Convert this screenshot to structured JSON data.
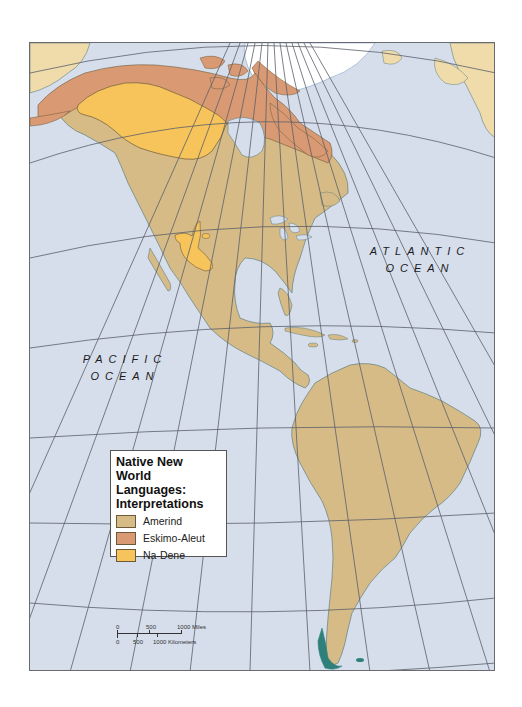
{
  "map": {
    "title": "Native New World Languages: Interpretations",
    "title_lines": [
      "Native New World",
      "Languages:",
      "Interpretations"
    ],
    "ocean_labels": {
      "atlantic": {
        "line1": "ATLANTIC",
        "line2": "OCEAN"
      },
      "pacific": {
        "line1": "PACIFIC",
        "line2": "OCEAN"
      }
    },
    "legend": {
      "items": [
        {
          "label": "Amerind",
          "color": "#d6bb86"
        },
        {
          "label": "Eskimo-Aleut",
          "color": "#d99a73"
        },
        {
          "label": "Na-Dene",
          "color": "#f6c45a"
        }
      ]
    },
    "scale_bar": {
      "miles_labels": [
        "0",
        "500",
        "1000 Miles"
      ],
      "km_labels": [
        "0",
        "500",
        "1000 Kilometers"
      ]
    },
    "colors": {
      "ocean": "#d6deec",
      "land_other": "#efdcaa",
      "ice": "#ffffff",
      "graticule": "#5a5f6a",
      "coast_detail": "#2f7f7a"
    }
  }
}
